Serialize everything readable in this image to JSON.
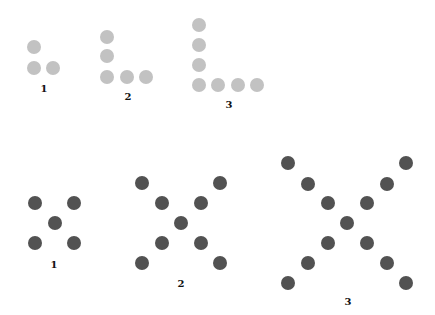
{
  "colors": {
    "light_dot": "#c2c2c2",
    "dark_dot": "#525252",
    "background": "#ffffff"
  },
  "dot_diameter": 14,
  "top_row": {
    "pattern": "L-shape",
    "figures": [
      {
        "label": "1",
        "label_pos": [
          44,
          89
        ],
        "dots": [
          [
            34,
            47
          ],
          [
            34,
            68
          ],
          [
            53,
            68
          ]
        ]
      },
      {
        "label": "2",
        "label_pos": [
          128,
          97
        ],
        "dots": [
          [
            107,
            37
          ],
          [
            107,
            56
          ],
          [
            107,
            77
          ],
          [
            127,
            77
          ],
          [
            146,
            77
          ]
        ]
      },
      {
        "label": "3",
        "label_pos": [
          229,
          105
        ],
        "dots": [
          [
            199,
            25
          ],
          [
            199,
            45
          ],
          [
            199,
            65
          ],
          [
            199,
            85
          ],
          [
            218,
            85
          ],
          [
            238,
            85
          ],
          [
            257,
            85
          ]
        ]
      }
    ]
  },
  "bottom_row": {
    "pattern": "X-shape",
    "figures": [
      {
        "label": "1",
        "label_pos": [
          54,
          265
        ],
        "dots": [
          [
            35,
            203
          ],
          [
            74,
            203
          ],
          [
            55,
            223
          ],
          [
            35,
            243
          ],
          [
            74,
            243
          ]
        ]
      },
      {
        "label": "2",
        "label_pos": [
          181,
          284
        ],
        "dots": [
          [
            142,
            183
          ],
          [
            220,
            183
          ],
          [
            162,
            203
          ],
          [
            201,
            203
          ],
          [
            181,
            223
          ],
          [
            162,
            243
          ],
          [
            201,
            243
          ],
          [
            142,
            263
          ],
          [
            220,
            263
          ]
        ]
      },
      {
        "label": "3",
        "label_pos": [
          348,
          302
        ],
        "dots": [
          [
            288,
            163
          ],
          [
            406,
            163
          ],
          [
            308,
            184
          ],
          [
            387,
            184
          ],
          [
            328,
            203
          ],
          [
            367,
            203
          ],
          [
            347,
            223
          ],
          [
            328,
            243
          ],
          [
            367,
            243
          ],
          [
            308,
            263
          ],
          [
            387,
            263
          ],
          [
            288,
            283
          ],
          [
            406,
            283
          ]
        ]
      }
    ]
  }
}
